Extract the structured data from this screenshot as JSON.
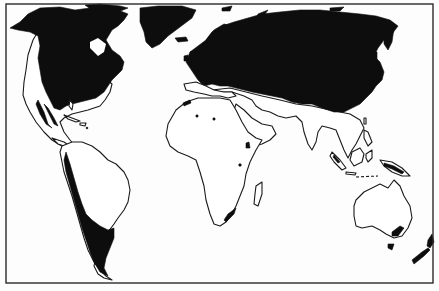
{
  "map": {
    "type": "world-outline-map",
    "projection": "pseudo-cylindrical",
    "style": "black-and-white line drawing",
    "colors": {
      "land_outline": "#1a1a1a",
      "shaded_region": "#0d0d0d",
      "background": "#ffffff",
      "frame": "#2a2a2a"
    },
    "shaded_regions": [
      "North America (Canada, northern/eastern United States, western mountains)",
      "Greenland",
      "Europe",
      "Northern and Central Asia (Russia, China, Japan)",
      "Andes and Patagonia (South America)",
      "Southeastern Australia",
      "Tasmania",
      "New Zealand",
      "New Guinea highlands",
      "Ethiopian and East African highlands",
      "Atlas mountains",
      "South African coast"
    ],
    "unshaded_regions": [
      "Central America",
      "South America (Amazon basin, Brazil)",
      "Africa",
      "Arabian Peninsula",
      "India",
      "Southeast Asia",
      "Australia (interior)"
    ],
    "frame": {
      "left": 6,
      "top": 4,
      "right": 433,
      "bottom": 283
    }
  }
}
